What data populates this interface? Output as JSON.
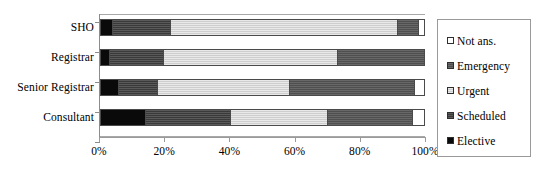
{
  "chart_data": {
    "type": "bar",
    "orientation": "horizontal",
    "stacked": true,
    "stack_mode": "percent",
    "title": "",
    "xlabel": "",
    "ylabel": "",
    "xlim": [
      0,
      100
    ],
    "grid": false,
    "legend_position": "right",
    "categories": [
      "SHO",
      "Registrar",
      "Senior Registrar",
      "Consultant"
    ],
    "tick_labels": [
      "0%",
      "20%",
      "40%",
      "60%",
      "80%",
      "100%"
    ],
    "tick_values": [
      0,
      20,
      40,
      60,
      80,
      100
    ],
    "series": [
      {
        "name": "Elective",
        "swatch": "#0a0a0a",
        "values": [
          3.4,
          2.5,
          5.2,
          13.5
        ]
      },
      {
        "name": "Scheduled",
        "swatch": "#3a3a3a",
        "values": [
          18.1,
          16.8,
          12.0,
          26.5
        ]
      },
      {
        "name": "Urgent",
        "swatch": "#cecece",
        "values": [
          70.2,
          53.7,
          41.1,
          30.0
        ]
      },
      {
        "name": "Emergency",
        "swatch": "#4f4f4f",
        "values": [
          6.3,
          27.0,
          38.7,
          26.3
        ]
      },
      {
        "name": "Not ans.",
        "swatch": "#ffffff",
        "values": [
          2.0,
          0.0,
          3.0,
          3.7
        ]
      }
    ],
    "legend_order": [
      "Not ans.",
      "Emergency",
      "Urgent",
      "Scheduled",
      "Elective"
    ]
  },
  "legend": {
    "items": [
      {
        "label": "Not ans.",
        "key": "notans"
      },
      {
        "label": "Emergency",
        "key": "emergency"
      },
      {
        "label": "Urgent",
        "key": "urgent"
      },
      {
        "label": "Scheduled",
        "key": "scheduled"
      },
      {
        "label": "Elective",
        "key": "elective"
      }
    ]
  }
}
